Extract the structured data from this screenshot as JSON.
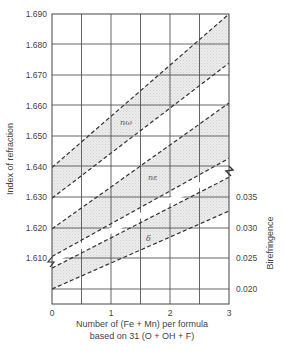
{
  "chart_data": {
    "type": "line",
    "title": "",
    "xlabel": "Number of (Fe + Mn) per formula based on 31 (O + OH + F)",
    "xlabel_lines": [
      "Number of (Fe + Mn) per formula",
      "based on 31 (O + OH + F)"
    ],
    "ylabel": "Index of refraction",
    "ylabel_right": "Birefringence",
    "xlim": [
      0,
      3
    ],
    "ylim": [
      1.6,
      1.69
    ],
    "ylim_right": [
      0.02,
      0.035
    ],
    "x_ticks": [
      "0",
      "1",
      "2",
      "3"
    ],
    "y_ticks": [
      "1.690",
      "1.680",
      "1.670",
      "1.660",
      "1.650",
      "1.640",
      "1.630",
      "1.620",
      "1.610"
    ],
    "y_ticks_right": [
      "0.035",
      "0.030",
      "0.025",
      "0.020"
    ],
    "grid": true,
    "legend": "inline labels",
    "band_labels": {
      "omega": "nω",
      "epsilon": "nε",
      "delta": "δ"
    },
    "series": [
      {
        "name": "nω upper bound",
        "axis": "left",
        "style": "dashed",
        "x": [
          0,
          3
        ],
        "values": [
          1.64,
          1.69
        ]
      },
      {
        "name": "nω lower bound",
        "axis": "left",
        "style": "dashed",
        "x": [
          0,
          3
        ],
        "values": [
          1.63,
          1.674
        ]
      },
      {
        "name": "nε upper bound",
        "axis": "left",
        "style": "dashed",
        "x": [
          0,
          3
        ],
        "values": [
          1.62,
          1.661
        ]
      },
      {
        "name": "nε lower bound",
        "axis": "left",
        "style": "dashed",
        "x": [
          0,
          3
        ],
        "values": [
          1.611,
          1.643
        ]
      },
      {
        "name": "δ upper bound",
        "axis": "right",
        "style": "dashed",
        "x": [
          0,
          3
        ],
        "values": [
          0.0234,
          0.0382
        ]
      },
      {
        "name": "δ lower bound",
        "axis": "right",
        "style": "dashed",
        "x": [
          0,
          3
        ],
        "values": [
          0.02,
          0.0327
        ]
      }
    ],
    "annotations": [
      "Shaded bands between paired dashed lines",
      "Axis break marks separating index and birefringence scales"
    ]
  }
}
